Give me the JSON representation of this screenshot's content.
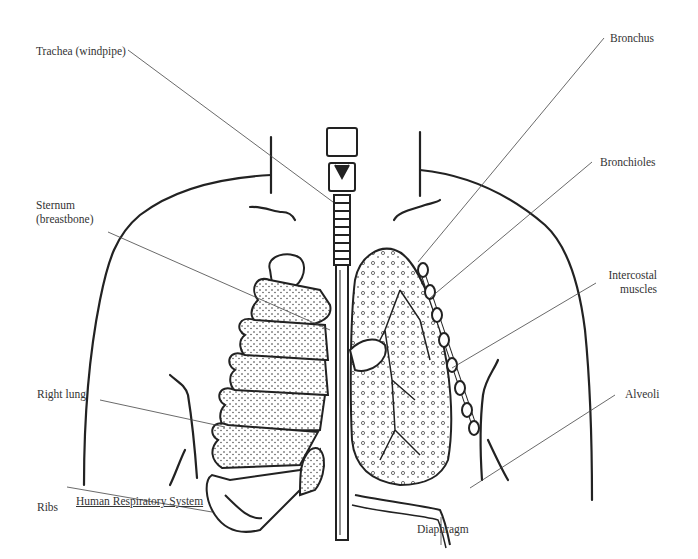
{
  "diagram": {
    "title": "Human Respiratory System",
    "labels": {
      "trachea": "Trachea (windpipe)",
      "sternum_line1": "Sternum",
      "sternum_line2": "(breastbone)",
      "right_lung": "Right lung",
      "ribs": "Ribs",
      "bronchus": "Bronchus",
      "bronchioles": "Bronchioles",
      "intercostal_line1": "Intercostal",
      "intercostal_line2": "muscles",
      "alveoli": "Alveoli",
      "diaphragm": "Diaphragm"
    },
    "colors": {
      "ink": "#222222",
      "leader": "#444444",
      "background": "#ffffff"
    }
  }
}
